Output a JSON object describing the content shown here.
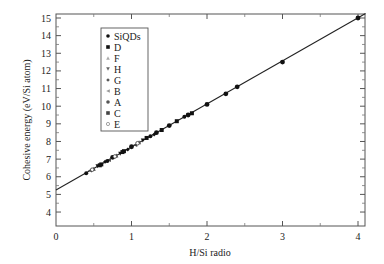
{
  "chart_data": {
    "type": "scatter",
    "title": "",
    "xlabel": "H/Si radio",
    "ylabel": "Cohesive energy (eV/Si atom)",
    "xlim": [
      0,
      4.1
    ],
    "ylim": [
      3.5,
      15.3
    ],
    "x_ticks": [
      0,
      1,
      2,
      3,
      4
    ],
    "x_tick_labels": [
      "0",
      "1",
      "2",
      "3",
      "4"
    ],
    "y_ticks": [
      4,
      5,
      6,
      7,
      8,
      9,
      10,
      11,
      12,
      13,
      14,
      15
    ],
    "y_tick_labels": [
      "4",
      "5",
      "6",
      "7",
      "8",
      "9",
      "10",
      "11",
      "12",
      "13",
      "14",
      "15"
    ],
    "grid": false,
    "legend_position": "upper-left-inside",
    "fit_line": {
      "slope": 2.44,
      "intercept": 5.25,
      "x_range": [
        0,
        4.1
      ]
    },
    "legend": [
      "SiQDs",
      "D",
      "F",
      "H",
      "G",
      "B",
      "A",
      "C",
      "E"
    ],
    "series": [
      {
        "name": "SiQDs",
        "marker": "circle",
        "points": [
          [
            0.75,
            7.1
          ],
          [
            1.0,
            7.7
          ],
          [
            1.33,
            8.5
          ],
          [
            1.5,
            8.9
          ],
          [
            1.75,
            9.5
          ],
          [
            2.0,
            10.1
          ],
          [
            2.25,
            10.7
          ],
          [
            2.4,
            11.1
          ],
          [
            3.0,
            12.5
          ],
          [
            4.0,
            15.0
          ]
        ]
      },
      {
        "name": "D",
        "marker": "square",
        "points": [
          [
            0.6,
            6.7
          ],
          [
            0.9,
            7.45
          ],
          [
            1.2,
            8.2
          ],
          [
            1.6,
            9.15
          ]
        ]
      },
      {
        "name": "F",
        "marker": "triangle-up",
        "points": [
          [
            0.5,
            6.45
          ],
          [
            0.8,
            7.2
          ],
          [
            1.1,
            7.95
          ]
        ]
      },
      {
        "name": "H",
        "marker": "triangle-down",
        "points": [
          [
            0.55,
            6.6
          ],
          [
            0.85,
            7.3
          ],
          [
            1.15,
            8.05
          ]
        ]
      },
      {
        "name": "G",
        "marker": "diamond",
        "points": [
          [
            0.65,
            6.85
          ],
          [
            0.95,
            7.55
          ],
          [
            1.3,
            8.4
          ]
        ]
      },
      {
        "name": "B",
        "marker": "triangle-left",
        "points": [
          [
            0.45,
            6.35
          ],
          [
            0.7,
            6.95
          ],
          [
            1.05,
            7.8
          ]
        ]
      },
      {
        "name": "A",
        "marker": "circle",
        "points": [
          [
            0.4,
            6.2
          ],
          [
            0.68,
            6.9
          ],
          [
            1.25,
            8.3
          ],
          [
            1.7,
            9.4
          ]
        ]
      },
      {
        "name": "C",
        "marker": "square",
        "points": [
          [
            0.58,
            6.65
          ],
          [
            0.88,
            7.4
          ],
          [
            1.4,
            8.65
          ],
          [
            1.8,
            9.6
          ]
        ]
      },
      {
        "name": "E",
        "marker": "circle-open",
        "points": [
          [
            0.48,
            6.4
          ],
          [
            0.78,
            7.15
          ],
          [
            1.08,
            7.9
          ]
        ]
      }
    ]
  }
}
